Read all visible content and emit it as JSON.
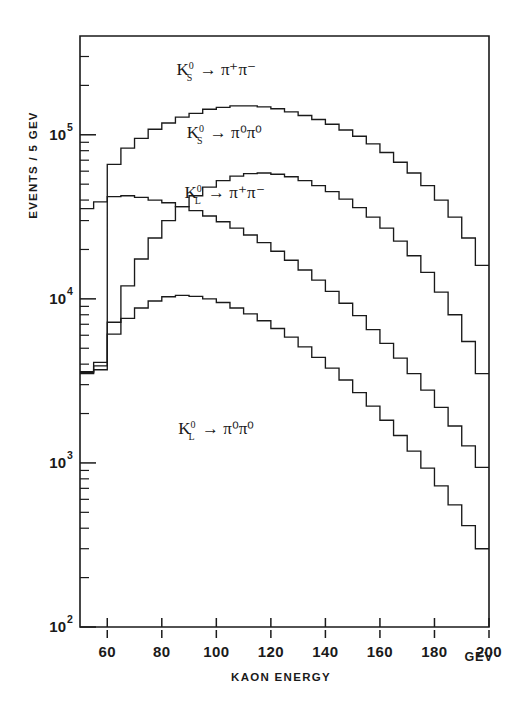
{
  "chart_data": {
    "type": "line",
    "subtype": "step-histogram",
    "title": "",
    "xlabel": "KAON ENERGY",
    "ylabel": "EVENTS / 5 GEV",
    "x_unit": "GEV",
    "xlim": [
      50,
      200
    ],
    "ylim": [
      100,
      400000
    ],
    "yscale": "log",
    "xscale": "linear",
    "grid": false,
    "legend": "inline-annotations",
    "bin_width": 5,
    "x_ticks": [
      60,
      80,
      100,
      120,
      140,
      160,
      180,
      200
    ],
    "x_tick_labels": [
      "60",
      "80",
      "100",
      "120",
      "140",
      "160",
      "180",
      "200"
    ],
    "y_ticks": [
      100,
      1000,
      10000,
      100000
    ],
    "y_tick_labels": [
      "10²",
      "10³",
      "10⁴",
      "10⁵"
    ],
    "y_tick_bases": [
      "10",
      "10",
      "10",
      "10"
    ],
    "y_tick_exponents": [
      "2",
      "3",
      "4",
      "5"
    ],
    "bin_edges": [
      50,
      55,
      60,
      65,
      70,
      75,
      80,
      85,
      90,
      95,
      100,
      105,
      110,
      115,
      120,
      125,
      130,
      135,
      140,
      145,
      150,
      155,
      160,
      165,
      170,
      175,
      180,
      185,
      190,
      195,
      200
    ],
    "bin_centers": [
      52.5,
      57.5,
      62.5,
      67.5,
      72.5,
      77.5,
      82.5,
      87.5,
      92.5,
      97.5,
      102.5,
      107.5,
      112.5,
      117.5,
      122.5,
      127.5,
      132.5,
      137.5,
      142.5,
      147.5,
      152.5,
      157.5,
      162.5,
      167.5,
      172.5,
      177.5,
      182.5,
      187.5,
      192.5,
      197.5
    ],
    "series": [
      {
        "name": "Ks_pi+pi-",
        "label_parts": {
          "particle": "K",
          "sub": "S",
          "sup": "0",
          "arrow": "→",
          "products": "π⁺π⁻"
        },
        "label_text": "K⁰S → π⁺π⁻",
        "label_x": 100,
        "label_y": 230000,
        "values": [
          35500,
          39000,
          66000,
          83000,
          95000,
          108000,
          118000,
          128000,
          135000,
          143000,
          147000,
          150000,
          150000,
          148000,
          144000,
          138000,
          131000,
          124000,
          116000,
          107000,
          98000,
          88000,
          78000,
          68000,
          58500,
          49000,
          40000,
          31500,
          23500,
          16000
        ]
      },
      {
        "name": "Ks_pi0pi0",
        "label_parts": {
          "particle": "K",
          "sub": "S",
          "sup": "0",
          "arrow": "→",
          "products": "π⁰π⁰"
        },
        "label_text": "K⁰S → π⁰π⁰",
        "label_x": 103,
        "label_y": 95000,
        "values": [
          3600,
          3900,
          7200,
          12000,
          17500,
          23500,
          30000,
          36500,
          42500,
          48000,
          52500,
          56000,
          58000,
          58500,
          57500,
          55500,
          52500,
          49000,
          45000,
          40500,
          36000,
          31500,
          27000,
          22500,
          18300,
          14500,
          11000,
          8000,
          5500,
          3500
        ]
      },
      {
        "name": "KL_pi+pi-",
        "label_parts": {
          "particle": "K",
          "sub": "L",
          "sup": "0",
          "arrow": "→",
          "products": "π⁺π⁻"
        },
        "label_text": "K⁰L → π⁺π⁻",
        "label_x": 103,
        "label_y": 41000,
        "values": [
          3550,
          4100,
          42000,
          42500,
          41500,
          40000,
          38500,
          36500,
          34500,
          32000,
          29500,
          27000,
          24500,
          22000,
          19500,
          17200,
          15000,
          13000,
          11100,
          9400,
          7900,
          6500,
          5350,
          4350,
          3500,
          2780,
          2180,
          1680,
          1270,
          940
        ]
      },
      {
        "name": "KL_pi0pi0",
        "label_parts": {
          "particle": "K",
          "sub": "L",
          "sup": "0",
          "arrow": "→",
          "products": "π⁰π⁰"
        },
        "label_text": "K⁰L → π⁰π⁰",
        "label_x": 100,
        "label_y": 1500,
        "values": [
          3500,
          3700,
          6100,
          7600,
          8800,
          9700,
          10300,
          10500,
          10350,
          10000,
          9500,
          8800,
          8100,
          7350,
          6600,
          5850,
          5100,
          4400,
          3780,
          3200,
          2680,
          2220,
          1820,
          1470,
          1180,
          930,
          725,
          555,
          415,
          300
        ]
      }
    ]
  },
  "colors": {
    "ink": "#1a1a1a",
    "background": "#ffffff"
  }
}
